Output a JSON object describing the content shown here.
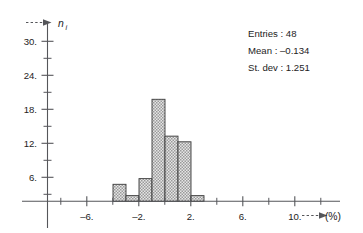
{
  "figure": {
    "name": "frequency-histogram",
    "background_color": "#ffffff",
    "ink_color": "#55565a",
    "bar_fill_color": "#d8d8d8",
    "bar_edge_color": "#3a3a3a"
  },
  "stats": {
    "entries_label": "Entries : 48",
    "mean_label": "Mean : –0.134",
    "stdev_label": "St. dev : 1.251"
  },
  "axes": {
    "y_title": "n",
    "y_subscript": "i",
    "x_unit_label": "(%)",
    "y_ticklabels": [
      "30.",
      "24.",
      "18.",
      "12.",
      "6."
    ],
    "x_ticklabels": [
      "–6.",
      "–2.",
      "2.",
      "6.",
      "10."
    ]
  },
  "chart_data": {
    "type": "bar",
    "title": "",
    "subtitle": "",
    "xlabel": "(%)",
    "ylabel": "n_i",
    "xlim": [
      -8,
      12
    ],
    "ylim": [
      0,
      33
    ],
    "grid": false,
    "legend": null,
    "bin_width": 1,
    "x_major_ticks": [
      -6,
      -2,
      2,
      6,
      10
    ],
    "x_minor_ticks": [
      -8,
      -7,
      -5,
      -4,
      -3,
      -1,
      0,
      1,
      3,
      4,
      5,
      7,
      8,
      9,
      11
    ],
    "y_major_ticks": [
      6,
      12,
      18,
      24,
      30
    ],
    "y_minor_ticks": [
      3,
      9,
      15,
      21,
      27
    ],
    "bin_edges": [
      -4,
      -3,
      -2,
      -1,
      0,
      1,
      2,
      3
    ],
    "categories": [
      "-4 to -3",
      "-3 to -2",
      "-2 to -1",
      "-1 to 0",
      "0 to 1",
      "1 to 2",
      "2 to 3"
    ],
    "values": [
      3,
      1,
      4,
      18,
      11.5,
      10.5,
      1
    ],
    "annotations": [
      "Entries : 48",
      "Mean : –0.134",
      "St. dev : 1.251"
    ],
    "summary": {
      "entries": 48,
      "mean": -0.134,
      "st_dev": 1.251
    }
  }
}
